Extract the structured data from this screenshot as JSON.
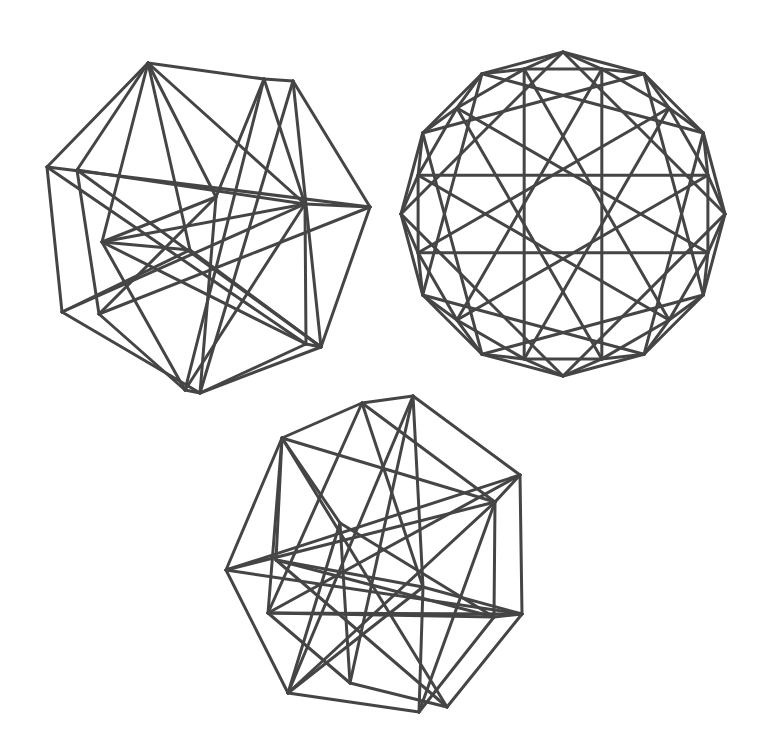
{
  "style": {
    "stroke": "#454545",
    "stroke_width": 3,
    "background": "#ffffff"
  },
  "figures": [
    {
      "name": "wireframe-figure-top-left",
      "vertices": [
        [
          148,
          63
        ],
        [
          264,
          79
        ],
        [
          293,
          81
        ],
        [
          47,
          167
        ],
        [
          77,
          170
        ],
        [
          216,
          197
        ],
        [
          305,
          204
        ],
        [
          370,
          207
        ],
        [
          102,
          242
        ],
        [
          190,
          250
        ],
        [
          62,
          312
        ],
        [
          99,
          314
        ],
        [
          306,
          344
        ],
        [
          321,
          347
        ],
        [
          185,
          390
        ],
        [
          200,
          393
        ]
      ],
      "edges": [
        [
          0,
          1
        ],
        [
          0,
          3
        ],
        [
          0,
          4
        ],
        [
          0,
          8
        ],
        [
          0,
          9
        ],
        [
          0,
          5
        ],
        [
          0,
          6
        ],
        [
          1,
          2
        ],
        [
          1,
          6
        ],
        [
          1,
          14
        ],
        [
          1,
          5
        ],
        [
          2,
          7
        ],
        [
          2,
          15
        ],
        [
          2,
          13
        ],
        [
          3,
          7
        ],
        [
          3,
          10
        ],
        [
          3,
          12
        ],
        [
          4,
          6
        ],
        [
          4,
          11
        ],
        [
          4,
          13
        ],
        [
          5,
          8
        ],
        [
          5,
          11
        ],
        [
          5,
          15
        ],
        [
          6,
          7
        ],
        [
          6,
          8
        ],
        [
          6,
          10
        ],
        [
          6,
          12
        ],
        [
          6,
          14
        ],
        [
          7,
          11
        ],
        [
          7,
          13
        ],
        [
          8,
          9
        ],
        [
          8,
          12
        ],
        [
          8,
          14
        ],
        [
          9,
          13
        ],
        [
          9,
          10
        ],
        [
          10,
          15
        ],
        [
          11,
          14
        ],
        [
          12,
          15
        ],
        [
          13,
          15
        ],
        [
          12,
          13
        ],
        [
          14,
          15
        ]
      ]
    },
    {
      "name": "wireframe-figure-top-right",
      "center": [
        563,
        214
      ],
      "outer_radius": 162,
      "inner_radius": 150,
      "sides": 12,
      "outer_rotation_deg": 90,
      "inner_rotation_deg": 105,
      "star_steps": [
        5
      ],
      "square_offsets": [
        3
      ]
    },
    {
      "name": "wireframe-figure-bottom",
      "vertices": [
        [
          362,
          403
        ],
        [
          413,
          396
        ],
        [
          282,
          438
        ],
        [
          520,
          475
        ],
        [
          495,
          502
        ],
        [
          226,
          570
        ],
        [
          268,
          613
        ],
        [
          340,
          523
        ],
        [
          423,
          587
        ],
        [
          288,
          693
        ],
        [
          350,
          683
        ],
        [
          419,
          712
        ],
        [
          447,
          707
        ],
        [
          494,
          617
        ],
        [
          522,
          614
        ],
        [
          276,
          560
        ]
      ],
      "edges": [
        [
          0,
          1
        ],
        [
          0,
          2
        ],
        [
          0,
          4
        ],
        [
          0,
          6
        ],
        [
          0,
          8
        ],
        [
          1,
          3
        ],
        [
          1,
          8
        ],
        [
          1,
          9
        ],
        [
          1,
          10
        ],
        [
          2,
          5
        ],
        [
          2,
          4
        ],
        [
          2,
          6
        ],
        [
          2,
          12
        ],
        [
          2,
          7
        ],
        [
          3,
          4
        ],
        [
          3,
          14
        ],
        [
          3,
          5
        ],
        [
          3,
          6
        ],
        [
          4,
          13
        ],
        [
          4,
          11
        ],
        [
          4,
          9
        ],
        [
          4,
          5
        ],
        [
          5,
          9
        ],
        [
          5,
          14
        ],
        [
          6,
          13
        ],
        [
          6,
          10
        ],
        [
          6,
          14
        ],
        [
          7,
          10
        ],
        [
          7,
          13
        ],
        [
          7,
          9
        ],
        [
          8,
          9
        ],
        [
          8,
          11
        ],
        [
          8,
          14
        ],
        [
          8,
          15
        ],
        [
          9,
          11
        ],
        [
          10,
          12
        ],
        [
          11,
          13
        ],
        [
          12,
          14
        ],
        [
          13,
          14
        ],
        [
          15,
          12
        ],
        [
          15,
          2
        ],
        [
          15,
          13
        ]
      ]
    }
  ]
}
